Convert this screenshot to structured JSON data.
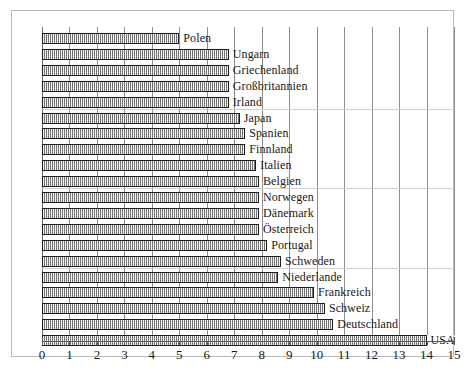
{
  "chart_data": {
    "type": "bar",
    "orientation": "horizontal",
    "title": "",
    "subtitle": "",
    "xlabel": "",
    "ylabel": "",
    "xlim": [
      0,
      15
    ],
    "xticks": [
      0,
      1,
      2,
      3,
      4,
      5,
      6,
      7,
      8,
      9,
      10,
      11,
      12,
      13,
      14,
      15
    ],
    "xtick_labels": [
      "0",
      "1",
      "2",
      "3",
      "4",
      "5",
      "6",
      "7",
      "8",
      "9",
      "10",
      "11",
      "12",
      "13",
      "14",
      "15"
    ],
    "grid": "vertical-major-plus-faint-horizontal",
    "legend": "none",
    "bar_style": {
      "fill": "#b4b4b4",
      "pattern": "dithered-gray-hatch",
      "border": "#1c1c1c"
    },
    "categories": [
      "Polen",
      "Ungarn",
      "Griechenland",
      "Großbritannien",
      "Irland",
      "Japan",
      "Spanien",
      "Finnland",
      "Italien",
      "Belgien",
      "Norwegen",
      "Dänemark",
      "Österreich",
      "Portugal",
      "Schweden",
      "Niederlande",
      "Frankreich",
      "Schweiz",
      "Deutschland",
      "USA"
    ],
    "values": [
      5.0,
      6.8,
      6.8,
      6.8,
      6.8,
      7.2,
      7.4,
      7.4,
      7.8,
      7.9,
      7.9,
      7.9,
      7.9,
      8.2,
      8.7,
      8.6,
      9.9,
      10.3,
      10.6,
      14.0
    ],
    "bars": [
      {
        "label": "Polen",
        "value": 5.0
      },
      {
        "label": "Ungarn",
        "value": 6.8
      },
      {
        "label": "Griechenland",
        "value": 6.8
      },
      {
        "label": "Großbritannien",
        "value": 6.8
      },
      {
        "label": "Irland",
        "value": 6.8
      },
      {
        "label": "Japan",
        "value": 7.2
      },
      {
        "label": "Spanien",
        "value": 7.4
      },
      {
        "label": "Finnland",
        "value": 7.4
      },
      {
        "label": "Italien",
        "value": 7.8
      },
      {
        "label": "Belgien",
        "value": 7.9
      },
      {
        "label": "Norwegen",
        "value": 7.9
      },
      {
        "label": "Dänemark",
        "value": 7.9
      },
      {
        "label": "Österreich",
        "value": 7.9
      },
      {
        "label": "Portugal",
        "value": 8.2
      },
      {
        "label": "Schweden",
        "value": 8.7
      },
      {
        "label": "Niederlande",
        "value": 8.6
      },
      {
        "label": "Frankreich",
        "value": 9.9
      },
      {
        "label": "Schweiz",
        "value": 10.3
      },
      {
        "label": "Deutschland",
        "value": 10.6
      },
      {
        "label": "USA",
        "value": 14.0
      }
    ]
  }
}
